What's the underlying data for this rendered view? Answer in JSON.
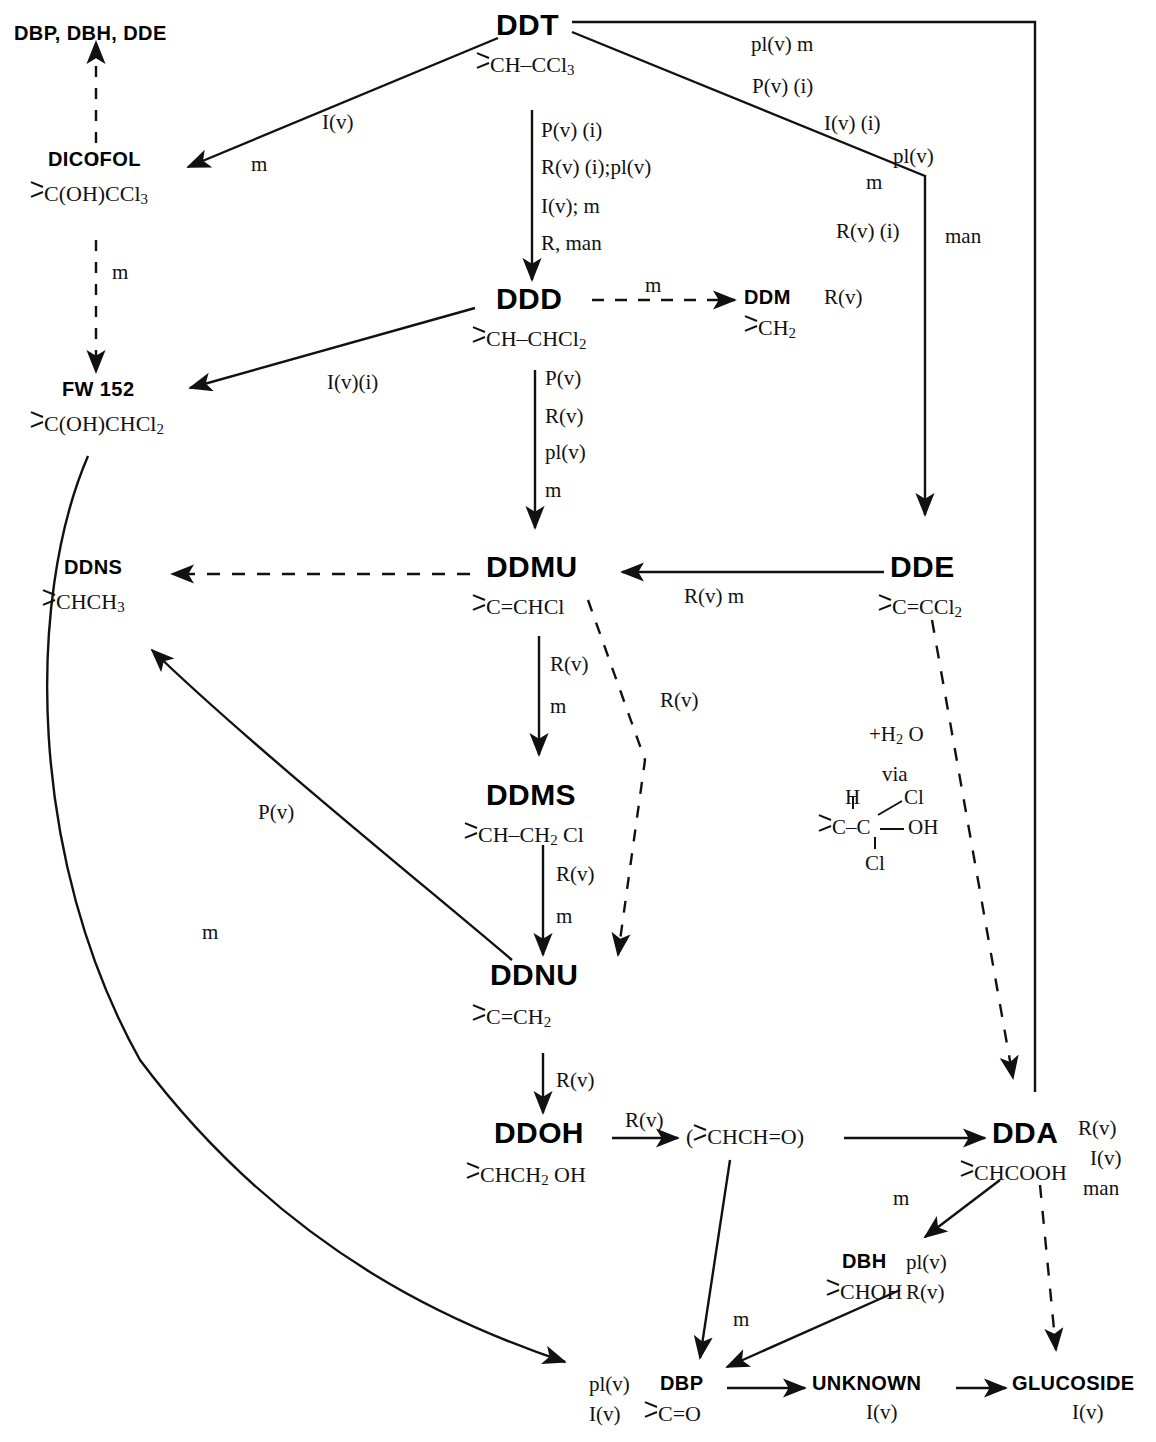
{
  "diagram": {
    "nodes": [
      {
        "id": "dbp_dbh_dde_top",
        "label": "DBP, DBH, DDE",
        "formula": ""
      },
      {
        "id": "ddt",
        "label": "DDT",
        "formula": "CH–CCl3"
      },
      {
        "id": "dicofol",
        "label": "DICOFOL",
        "formula": "C(OH)CCl3"
      },
      {
        "id": "fw152",
        "label": "FW 152",
        "formula": "C(OH)CHCl2"
      },
      {
        "id": "ddd",
        "label": "DDD",
        "formula": "CH–CHCl2"
      },
      {
        "id": "ddm",
        "label": "DDM",
        "formula": "CH2"
      },
      {
        "id": "ddns",
        "label": "DDNS",
        "formula": "CHCH3"
      },
      {
        "id": "ddmu",
        "label": "DDMU",
        "formula": "C=CHCl"
      },
      {
        "id": "dde",
        "label": "DDE",
        "formula": "C=CCl2"
      },
      {
        "id": "ddms",
        "label": "DDMS",
        "formula": "CH–CH2 Cl"
      },
      {
        "id": "ddnu",
        "label": "DDNU",
        "formula": "C=CH2"
      },
      {
        "id": "ddoh",
        "label": "DDOH",
        "formula": "CHCH2 OH"
      },
      {
        "id": "aldehyde",
        "label": "(CHCH=O)",
        "formula": ""
      },
      {
        "id": "dda",
        "label": "DDA",
        "formula": "CHCOOH"
      },
      {
        "id": "dbh",
        "label": "DBH",
        "formula": "CHOH"
      },
      {
        "id": "dbp",
        "label": "DBP",
        "formula": "C=O"
      },
      {
        "id": "unknown",
        "label": "UNKNOWN",
        "formula": ""
      },
      {
        "id": "glucoside",
        "label": "GLUCOSIDE",
        "formula": ""
      }
    ],
    "edge_labels": {
      "ddt_to_dicofol_1": "I(v)",
      "ddt_to_dicofol_2": "m",
      "dicofol_to_fw152": "m",
      "ddt_to_ddd_1": "P(v) (i)",
      "ddt_to_ddd_2": "R(v) (i);pl(v)",
      "ddt_to_ddd_3": "I(v); m",
      "ddt_to_ddd_4": "R, man",
      "ddt_right_1": "pl(v)  m",
      "ddt_right_2": "P(v) (i)",
      "ddt_right_3": "I(v) (i)",
      "ddt_right_4": "pl(v)",
      "ddt_right_5": "m",
      "ddt_right_6": "R(v) (i)",
      "ddt_right_7": "man",
      "ddd_to_ddm": "m",
      "ddm_side": "R(v)",
      "ddd_to_fw152": "I(v)(i)",
      "ddd_to_ddmu_1": "P(v)",
      "ddd_to_ddmu_2": "R(v)",
      "ddd_to_ddmu_3": "pl(v)",
      "ddd_to_ddmu_4": "m",
      "dde_to_ddmu_1": "R(v)  m",
      "ddmu_to_ddms_1": "R(v)",
      "ddmu_to_ddms_2": "m",
      "ddmu_to_ddnu": "R(v)",
      "dde_to_dda_1": "+H2 O",
      "dde_to_dda_2": "via",
      "ddms_to_ddnu_1": "R(v)",
      "ddms_to_ddnu_2": "m",
      "ddnu_to_ddns": "P(v)",
      "fw152_to_dbp": "m",
      "ddnu_to_ddoh": "R(v)",
      "ddoh_to_aldehyde": "R(v)",
      "dda_side_1": "R(v)",
      "dda_side_2": "I(v)",
      "dda_side_3": "man",
      "dda_to_dbh": "m",
      "dbh_side_1": "pl(v)",
      "dbh_side_2": "R(v)",
      "dbh_to_dbp": "m",
      "dbp_left_1": "pl(v)",
      "dbp_left_2": "I(v)",
      "unknown_sub": "I(v)",
      "glucoside_sub": "I(v)"
    },
    "dde_hydrolysis_structure": {
      "top_left": "H",
      "top_right": "Cl",
      "center_left": "C",
      "center_right": "C",
      "right": "OH",
      "bottom": "Cl"
    },
    "colors": {
      "ink": "#111111",
      "background": "#ffffff"
    }
  }
}
